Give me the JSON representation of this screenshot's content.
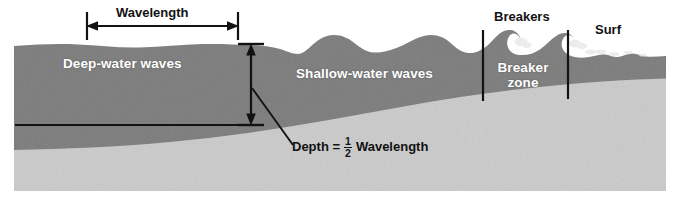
{
  "figure": {
    "background_color": "#ffffff"
  },
  "colors": {
    "water": "#7b7b7b",
    "water_dark": "#6f6f6f",
    "seafloor": "#c9c9c9",
    "seafloor_light": "#d2d2d2",
    "line": "#121212",
    "label_light": "#ffffff",
    "label_dark": "#121212"
  },
  "labels": {
    "wavelength": "Wavelength",
    "deep_water": "Deep-water waves",
    "shallow_water": "Shallow-water waves",
    "breakers": "Breakers",
    "surf": "Surf",
    "breaker_zone_line1": "Breaker",
    "breaker_zone_line2": "zone",
    "depth_eq_lead": "Depth =",
    "depth_eq_numerator": "1",
    "depth_eq_denominator": "2",
    "depth_eq_trail": "Wavelength"
  },
  "annotations": {
    "wavelength_measure": {
      "name": "wavelength",
      "kind": "double-headed-horizontal-arrow",
      "x_start": 87,
      "x_end": 238,
      "y": 26,
      "tick_top": 12,
      "tick_bottom": 40
    },
    "depth_measure": {
      "name": "depth",
      "kind": "double-headed-vertical-arrow",
      "x": 251,
      "y_top": 44,
      "y_bottom": 125,
      "tick_width": 26,
      "relation": "Depth = 1/2 Wavelength"
    },
    "depth_reference_line": {
      "name": "half-wavelength-depth-line",
      "kind": "horizontal-rule",
      "x_start": 15,
      "x_end": 256,
      "y": 125
    },
    "leader_line": {
      "name": "depth-equation-leader",
      "kind": "diagonal-line",
      "x_start": 252,
      "y_start": 88,
      "x_end": 292,
      "y_end": 144
    },
    "breaker_zone_bounds": [
      {
        "name": "breaker-zone-left-boundary",
        "x": 483,
        "y_top": 30,
        "y_bottom": 101
      },
      {
        "name": "breaker-zone-right-boundary",
        "x": 568,
        "y_top": 30,
        "y_bottom": 99
      }
    ]
  },
  "zones": [
    {
      "id": "deep-water",
      "label": "Deep-water waves",
      "x_start": 14,
      "x_end": 250
    },
    {
      "id": "shallow-water",
      "label": "Shallow-water waves",
      "x_start": 250,
      "x_end": 483
    },
    {
      "id": "breaker-zone",
      "label": "Breaker zone",
      "x_start": 483,
      "x_end": 568
    },
    {
      "id": "surf-zone",
      "label": "Surf",
      "x_start": 568,
      "x_end": 666
    }
  ],
  "geometry": {
    "frame": {
      "x": 14,
      "y": 32,
      "width": 652,
      "height": 158
    },
    "water_surface_note": "gentle low swells at left, growing rounded crests mid, curling breakers right, choppy surf at shore",
    "seafloor_note": "flat-ish at left near y=150, rising steadily to the right shoreline"
  }
}
